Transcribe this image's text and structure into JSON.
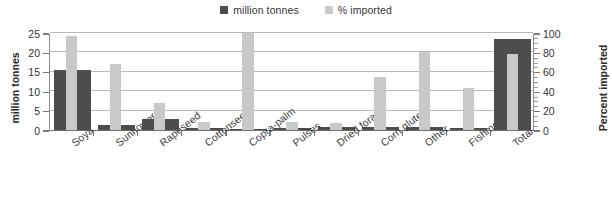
{
  "chart_data": {
    "type": "bar",
    "title": "",
    "subtitle": "",
    "xlabel": "",
    "ylabel": "million tonnes",
    "y2label": "Percent imported",
    "ylim": [
      0,
      25
    ],
    "y2lim": [
      0,
      100
    ],
    "yticks": [
      0,
      5,
      10,
      15,
      20,
      25
    ],
    "y2ticks": [
      0,
      20,
      40,
      60,
      80,
      100
    ],
    "y2_minor_step": 5,
    "grid": true,
    "grid_axis": "y",
    "legend_position": "top-center",
    "categories": [
      "Soya",
      "Sunflower",
      "Rapeseed",
      "Cottonseed",
      "Copra-palm",
      "Pulses",
      "Dried forage",
      "Corn gluten",
      "Other",
      "Fishmeal",
      "Total"
    ],
    "series": [
      {
        "name": "million tonnes",
        "axis": "left",
        "color": "#4d4d4d",
        "values": [
          15.5,
          1.2,
          2.9,
          0.4,
          0.3,
          0.6,
          0.7,
          0.7,
          0.8,
          0.5,
          23.5
        ]
      },
      {
        "name": "% imported",
        "axis": "right",
        "color": "#c9c9c9",
        "values": [
          97,
          68,
          28,
          8,
          100,
          8,
          7,
          55,
          80,
          43,
          78
        ]
      }
    ]
  },
  "legend": {
    "entries": [
      {
        "label": "million tonnes",
        "color": "#4d4d4d"
      },
      {
        "label": "% imported",
        "color": "#c9c9c9"
      }
    ]
  },
  "axes": {
    "left": {
      "title": "million tonnes",
      "tick_labels": [
        "25",
        "20",
        "15",
        "10",
        "5",
        "0"
      ]
    },
    "right": {
      "title": "Percent imported",
      "tick_labels": [
        "100",
        "80",
        "60",
        "40",
        "20",
        "0"
      ]
    }
  }
}
